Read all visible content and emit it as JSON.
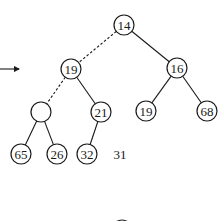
{
  "diagram": {
    "type": "binary-heap-tree",
    "arrow": {
      "x1": 0,
      "y1": 69,
      "x2": 19,
      "y2": 69
    },
    "nodes": [
      {
        "id": "n14",
        "label": "14",
        "cx": 124,
        "cy": 25
      },
      {
        "id": "n19a",
        "label": "19",
        "cx": 71,
        "cy": 69
      },
      {
        "id": "n16",
        "label": "16",
        "cx": 177,
        "cy": 68
      },
      {
        "id": "nhole",
        "label": "",
        "cx": 41,
        "cy": 112
      },
      {
        "id": "n21",
        "label": "21",
        "cx": 101,
        "cy": 112
      },
      {
        "id": "n19b",
        "label": "19",
        "cx": 146,
        "cy": 111
      },
      {
        "id": "n68",
        "label": "68",
        "cx": 207,
        "cy": 111
      },
      {
        "id": "n65",
        "label": "65",
        "cx": 21,
        "cy": 154
      },
      {
        "id": "n26",
        "label": "26",
        "cx": 57,
        "cy": 154
      },
      {
        "id": "n32",
        "label": "32",
        "cx": 87,
        "cy": 154
      }
    ],
    "edges": [
      {
        "from": "n14",
        "to": "n19a",
        "style": "dashed"
      },
      {
        "from": "n14",
        "to": "n16",
        "style": "solid"
      },
      {
        "from": "n19a",
        "to": "nhole",
        "style": "dashed"
      },
      {
        "from": "n19a",
        "to": "n21",
        "style": "solid"
      },
      {
        "from": "n16",
        "to": "n19b",
        "style": "solid"
      },
      {
        "from": "n16",
        "to": "n68",
        "style": "solid"
      },
      {
        "from": "nhole",
        "to": "n65",
        "style": "solid"
      },
      {
        "from": "nhole",
        "to": "n26",
        "style": "solid"
      },
      {
        "from": "n21",
        "to": "n32",
        "style": "solid"
      }
    ],
    "pending_value": {
      "label": "31",
      "x": 120,
      "y": 154
    },
    "partial_node_bottom": {
      "cx": 122,
      "cy": 230,
      "r": 10
    },
    "node_radius": 10
  }
}
